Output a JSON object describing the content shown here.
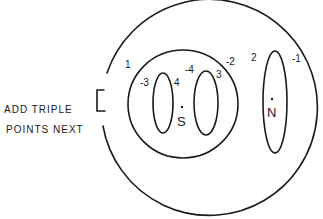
{
  "note": {
    "line1": "ADD TRIPLE",
    "line2": "POINTS NEXT"
  },
  "labels": {
    "outer_region": "1",
    "left_oval_left": "-3",
    "left_oval_right": "4",
    "mid_oval_left": "-4",
    "mid_oval_right": "3",
    "inner_region_edge": "-2",
    "tall_oval_left": "2",
    "tall_oval_right": "-1"
  },
  "points": {
    "s": "S",
    "n": "N"
  },
  "colors": {
    "ink": "#1a1a1a",
    "paper": "#ffffff"
  }
}
